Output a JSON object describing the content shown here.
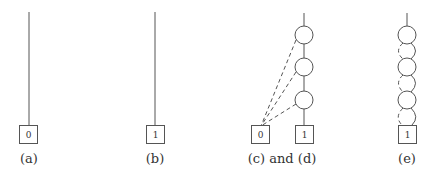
{
  "panels": [
    {
      "id": "a",
      "caption": "(a)",
      "terminal": "0"
    },
    {
      "id": "b",
      "caption": "(b)",
      "terminal": "1"
    },
    {
      "id": "cd",
      "caption": "(c) and (d)",
      "terminals": [
        "0",
        "1"
      ],
      "node_count": 3
    },
    {
      "id": "e",
      "caption": "(e)",
      "terminal": "1",
      "node_count": 3
    }
  ],
  "colors": {
    "stroke": "#555555",
    "background": "#ffffff",
    "text": "#333333"
  }
}
